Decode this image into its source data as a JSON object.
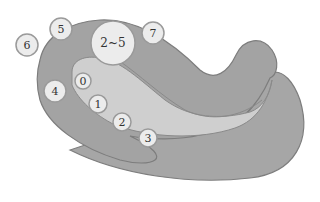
{
  "diagram": {
    "type": "anatomical-region-map",
    "colors": {
      "outer_region": "#a3a3a3",
      "inner_region": "#cfcfcf",
      "outline": "#7d7d7d",
      "circle_fill": "#ececec",
      "circle_stroke": "#9a9a9a"
    },
    "markers": [
      {
        "id": "m6",
        "label": "6",
        "x": 27,
        "y": 45,
        "r": 11
      },
      {
        "id": "m5",
        "label": "5",
        "x": 61,
        "y": 29,
        "r": 11
      },
      {
        "id": "m2-5",
        "label": "2~5",
        "x": 113,
        "y": 43,
        "r": 22
      },
      {
        "id": "m7",
        "label": "7",
        "x": 153,
        "y": 33,
        "r": 11
      },
      {
        "id": "m4",
        "label": "4",
        "x": 55,
        "y": 91,
        "r": 11
      },
      {
        "id": "m0",
        "label": "0",
        "x": 83,
        "y": 81,
        "r": 8
      },
      {
        "id": "m1",
        "label": "1",
        "x": 98,
        "y": 104,
        "r": 9
      },
      {
        "id": "m2",
        "label": "2",
        "x": 122,
        "y": 122,
        "r": 9
      },
      {
        "id": "m3",
        "label": "3",
        "x": 148,
        "y": 138,
        "r": 9
      }
    ]
  }
}
